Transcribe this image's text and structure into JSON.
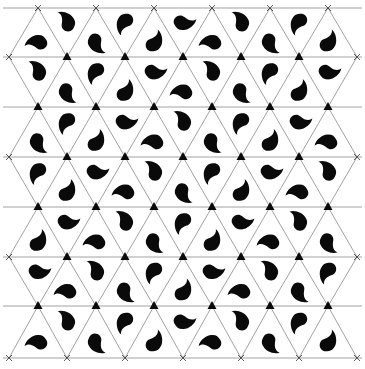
{
  "artwork": {
    "title": "",
    "background": "#ffffff",
    "line_color": "#8a8a8a",
    "ink_color": "#0a0a0a",
    "grid": {
      "type": "triangular",
      "row_y": [
        8,
        57,
        107,
        157,
        207,
        257,
        306,
        358
      ],
      "col_spacing": 58,
      "even_row_start_x": 38,
      "odd_row_start_x": 9,
      "even_row_count": 6,
      "odd_row_count": 7,
      "left_edge_x": 9,
      "right_edge_x": 356
    },
    "vertex_markers": {
      "interior": "filled-triangle",
      "edge": "x-mark"
    },
    "motif": {
      "name": "paisley",
      "one_per_triangle": true,
      "up_triangle_base_angle": 30,
      "down_triangle_base_angle": 210,
      "rotation_step": 120,
      "cycle": 3
    }
  }
}
